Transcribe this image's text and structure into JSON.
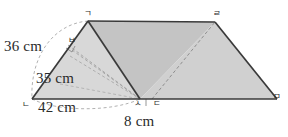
{
  "figure": {
    "kind": "geometry-diagram",
    "colors": {
      "stroke": "#3a3a3a",
      "dashed_stroke": "#9a9a9a",
      "fill_left_triangle": "#d8d8d8",
      "fill_center_triangle": "#c4c4c4",
      "fill_right_region": "#d0d0d0",
      "text": "#2b2b2b",
      "background": "#ffffff"
    },
    "dimension_labels": [
      {
        "id": "len-36",
        "text": "36 cm"
      },
      {
        "id": "len-35",
        "text": "35 cm"
      },
      {
        "id": "len-42",
        "text": "42 cm"
      },
      {
        "id": "len-8",
        "text": "8 cm"
      }
    ],
    "vertex_labels": [
      {
        "id": "vertex-g",
        "text": "ㄱ"
      },
      {
        "id": "vertex-n",
        "text": "ㄴ"
      },
      {
        "id": "vertex-d",
        "text": "ㄷ"
      },
      {
        "id": "vertex-r",
        "text": "ㄹ"
      },
      {
        "id": "vertex-m",
        "text": "ㅁ"
      },
      {
        "id": "vertex-b",
        "text": "ㅂ"
      },
      {
        "id": "vertex-s",
        "text": "ㅅ"
      }
    ]
  }
}
